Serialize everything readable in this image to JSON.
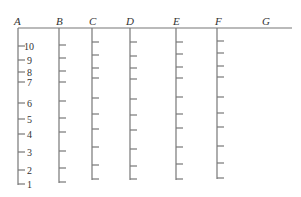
{
  "diagram": {
    "top_line_label": "G",
    "columns": [
      {
        "label": "A",
        "tick_labels": [
          "10",
          "9",
          "8",
          "7",
          "6",
          "5",
          "4",
          "3",
          "2",
          "1"
        ]
      },
      {
        "label": "B",
        "tick_labels": []
      },
      {
        "label": "C",
        "tick_labels": []
      },
      {
        "label": "D",
        "tick_labels": []
      },
      {
        "label": "E",
        "tick_labels": []
      },
      {
        "label": "F",
        "tick_labels": []
      }
    ],
    "ticks_per_column": 10
  }
}
